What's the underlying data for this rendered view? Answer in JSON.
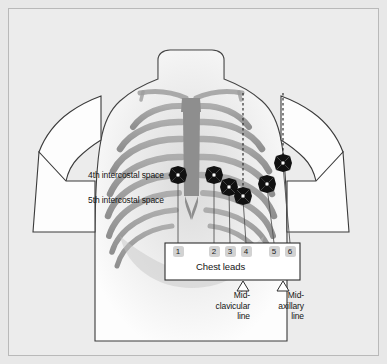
{
  "figure": {
    "background_color": "#e8e8e8",
    "frame_color": "#b9b9b9"
  },
  "annotations": {
    "intercostal_4": "4th intercostal space",
    "intercostal_5": "5th intercostal space",
    "chest_leads_label": "Chest leads",
    "midclavicular_line": "Mid-\nclavicular\nline",
    "midclavicular_line_l1": "Mid-",
    "midclavicular_line_l2": "clavicular",
    "midclavicular_line_l3": "line",
    "midaxillary_line_l1": "Mid-",
    "midaxillary_line_l2": "axillary",
    "midaxillary_line_l3": "line"
  },
  "leads": [
    {
      "number": "1",
      "box_x": 178,
      "electrode_x": 178,
      "electrode_y": 175
    },
    {
      "number": "2",
      "box_x": 214,
      "electrode_x": 214,
      "electrode_y": 175
    },
    {
      "number": "3",
      "box_x": 230,
      "electrode_x": 229,
      "electrode_y": 187
    },
    {
      "number": "4",
      "box_x": 246,
      "electrode_x": 243,
      "electrode_y": 196
    },
    {
      "number": "5",
      "box_x": 274,
      "electrode_x": 267,
      "electrode_y": 184
    },
    {
      "number": "6",
      "box_x": 290,
      "electrode_x": 283,
      "electrode_y": 163
    }
  ],
  "reference_lines": [
    {
      "name": "mid-clavicular",
      "x": 243,
      "pointer_x": 243
    },
    {
      "name": "mid-axillary",
      "x": 283,
      "pointer_x": 283
    }
  ],
  "colors": {
    "electrode": "#111111",
    "electrode_center": "#ffffff",
    "rib": "#9a9a9a",
    "sternum": "#8e8e8e",
    "torso_fill": "#fdfdfd",
    "torso_outline": "#3a3a3a",
    "lead_badge": "#d2d2d2",
    "leader_line": "#555555",
    "box_outline": "#2e2e2e"
  }
}
